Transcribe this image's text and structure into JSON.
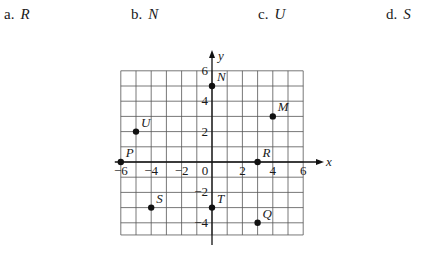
{
  "choices": [
    {
      "letter": "a.",
      "value": "R"
    },
    {
      "letter": "b.",
      "value": "N"
    },
    {
      "letter": "c.",
      "value": "U"
    },
    {
      "letter": "d.",
      "value": "S"
    }
  ],
  "chart_data": {
    "type": "scatter",
    "title": "",
    "xlabel": "x",
    "ylabel": "y",
    "xlim": [
      -6,
      6
    ],
    "ylim": [
      -4.8,
      6
    ],
    "grid": true,
    "grid_step": 1,
    "x_ticks": [
      -6,
      -4,
      -2,
      0,
      2,
      4,
      6
    ],
    "y_ticks": [
      -4,
      -2,
      2,
      4,
      6
    ],
    "x_tick_labels": [
      "−6",
      "−4",
      "−2",
      "0",
      "2",
      "4",
      "6"
    ],
    "y_tick_labels": [
      "−4",
      "−2",
      "2",
      "4",
      "6"
    ],
    "points": [
      {
        "label": "N",
        "x": 0,
        "y": 5
      },
      {
        "label": "M",
        "x": 4,
        "y": 3
      },
      {
        "label": "U",
        "x": -5,
        "y": 2
      },
      {
        "label": "P",
        "x": -6,
        "y": 0
      },
      {
        "label": "R",
        "x": 3,
        "y": 0
      },
      {
        "label": "S",
        "x": -4,
        "y": -3
      },
      {
        "label": "T",
        "x": 0,
        "y": -3
      },
      {
        "label": "Q",
        "x": 3,
        "y": -4
      }
    ]
  }
}
